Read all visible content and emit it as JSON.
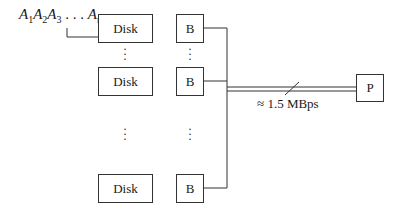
{
  "diagram": {
    "sequence": {
      "parts": [
        {
          "base": "A",
          "sub": "1"
        },
        {
          "base": "A",
          "sub": "2"
        },
        {
          "base": "A",
          "sub": "3"
        },
        {
          "base": " . . . ",
          "sub": ""
        },
        {
          "base": "A",
          "sub": "n"
        }
      ]
    },
    "disks": [
      {
        "label": "Disk"
      },
      {
        "label": "Disk"
      },
      {
        "label": "Disk"
      }
    ],
    "buffers": [
      {
        "label": "B"
      },
      {
        "label": "B"
      },
      {
        "label": "B"
      }
    ],
    "processor": {
      "label": "P"
    },
    "bus": {
      "rate_label": "≈ 1.5 MBps"
    },
    "ellipsis": "⋮",
    "colors": {
      "line": "#333333",
      "text": "#1a1a1a",
      "background": "#ffffff"
    }
  }
}
